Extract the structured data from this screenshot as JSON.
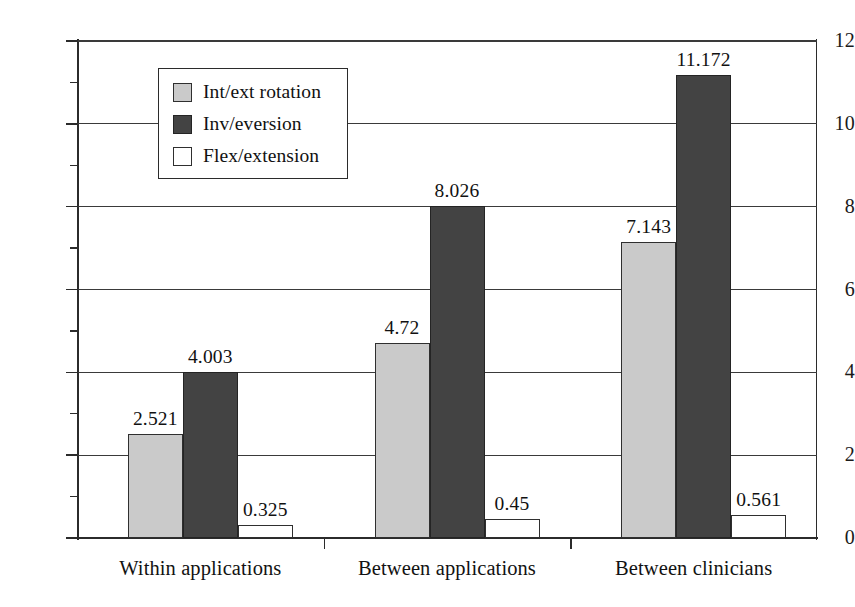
{
  "chart_data": {
    "type": "bar",
    "title": "",
    "subtitle": "",
    "xlabel": "",
    "ylabel": "",
    "ylim": [
      0,
      12
    ],
    "ytick_labels": [
      "0",
      "2",
      "4",
      "6",
      "8",
      "10",
      "12"
    ],
    "ytick_values": [
      0,
      2,
      4,
      6,
      8,
      10,
      12
    ],
    "minor_tick_values": [
      1,
      3,
      5,
      7,
      9,
      11
    ],
    "grid": "horizontal",
    "legend_position": "upper-left-inside",
    "categories": [
      "Within applications",
      "Between applications",
      "Between clinicians"
    ],
    "series": [
      {
        "name": "Int/ext rotation",
        "color": "#cacaca",
        "values": [
          2.521,
          4.72,
          7.143
        ],
        "labels": [
          "2.521",
          "4.72",
          "7.143"
        ]
      },
      {
        "name": "Inv/eversion",
        "color": "#434343",
        "values": [
          4.003,
          8.026,
          11.172
        ],
        "labels": [
          "4.003",
          "8.026",
          "11.172"
        ]
      },
      {
        "name": "Flex/extension",
        "color": "#ffffff",
        "values": [
          0.325,
          0.45,
          0.561
        ],
        "labels": [
          "0.325",
          "0.45",
          "0.561"
        ]
      }
    ]
  },
  "legend": {
    "items": [
      {
        "label": "Int/ext rotation",
        "swatch": "legend-swatch-int-ext-rotation"
      },
      {
        "label": "Inv/eversion",
        "swatch": "legend-swatch-inv-eversion"
      },
      {
        "label": "Flex/extension",
        "swatch": "legend-swatch-flex-extension"
      }
    ]
  },
  "axis": {
    "y_labels": [
      "12",
      "10",
      "8",
      "6",
      "4",
      "2",
      "0"
    ],
    "x_labels": [
      "Within applications",
      "Between applications",
      "Between clinicians"
    ]
  }
}
